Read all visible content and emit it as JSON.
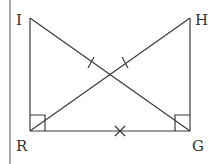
{
  "diagram": {
    "type": "geometry",
    "colors": {
      "stroke": "#3a3a3a",
      "text": "#333333",
      "background": "#ffffff"
    },
    "points": {
      "I": {
        "label": "I",
        "x": 30,
        "y": 18
      },
      "H": {
        "label": "H",
        "x": 190,
        "y": 18
      },
      "R": {
        "label": "R",
        "x": 30,
        "y": 131
      },
      "G": {
        "label": "G",
        "x": 190,
        "y": 131
      }
    },
    "segments": [
      "IR",
      "HG",
      "RG",
      "IG",
      "HR"
    ],
    "right_angles": [
      "R",
      "G"
    ],
    "congruence_marks": [
      {
        "segment": "IG",
        "mark": "single-tick"
      },
      {
        "segment": "HR",
        "mark": "single-tick"
      },
      {
        "segment": "RG",
        "mark": "shared-cross"
      }
    ]
  }
}
